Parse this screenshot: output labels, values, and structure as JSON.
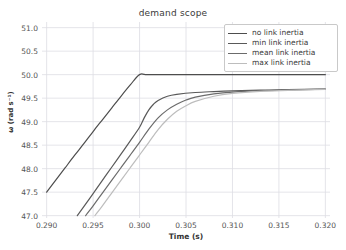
{
  "chart_data": {
    "type": "line",
    "title": "demand scope",
    "xlabel": "Time (s)",
    "ylabel": "ω (rad s⁻¹)",
    "xlim": [
      0.2895,
      0.3205
    ],
    "ylim": [
      46.95,
      51.12
    ],
    "grid": true,
    "legend_position": "upper right",
    "xticks": [
      0.29,
      0.295,
      0.3,
      0.305,
      0.31,
      0.315,
      0.32
    ],
    "xticklabels": [
      "0.290",
      "0.295",
      "0.300",
      "0.305",
      "0.310",
      "0.315",
      "0.320"
    ],
    "yticks": [
      47.0,
      47.5,
      48.0,
      48.5,
      49.0,
      49.5,
      50.0,
      50.5,
      51.0
    ],
    "yticklabels": [
      "47.0",
      "47.5",
      "48.0",
      "48.5",
      "49.0",
      "49.5",
      "50.0",
      "50.5",
      "51.0"
    ],
    "series": [
      {
        "name": "no link inertia",
        "color": "#4d4d4d",
        "width": 1.2,
        "x": [
          0.29,
          0.291,
          0.292,
          0.293,
          0.294,
          0.295,
          0.296,
          0.297,
          0.298,
          0.299,
          0.3,
          0.301,
          0.305,
          0.31,
          0.315,
          0.32
        ],
        "y": [
          47.5,
          47.76,
          48.02,
          48.28,
          48.53,
          48.79,
          49.04,
          49.29,
          49.54,
          49.78,
          50.0,
          50.0,
          50.0,
          50.0,
          50.0,
          50.0
        ]
      },
      {
        "name": "min link inertia",
        "color": "#595959",
        "width": 1.2,
        "x": [
          0.2933,
          0.294,
          0.295,
          0.296,
          0.297,
          0.298,
          0.299,
          0.3,
          0.3005,
          0.301,
          0.3015,
          0.302,
          0.303,
          0.304,
          0.306,
          0.308,
          0.31,
          0.313,
          0.316,
          0.32
        ],
        "y": [
          47.0,
          47.19,
          47.47,
          47.75,
          48.03,
          48.31,
          48.59,
          48.88,
          49.08,
          49.25,
          49.37,
          49.45,
          49.54,
          49.58,
          49.62,
          49.64,
          49.655,
          49.67,
          49.68,
          49.69
        ]
      },
      {
        "name": "mean link inertia",
        "color": "#6b6b6b",
        "width": 1.2,
        "x": [
          0.2942,
          0.295,
          0.296,
          0.297,
          0.298,
          0.299,
          0.3,
          0.301,
          0.302,
          0.303,
          0.304,
          0.305,
          0.306,
          0.308,
          0.31,
          0.313,
          0.316,
          0.32
        ],
        "y": [
          47.0,
          47.21,
          47.48,
          47.75,
          48.02,
          48.29,
          48.56,
          48.84,
          49.08,
          49.25,
          49.37,
          49.46,
          49.52,
          49.59,
          49.63,
          49.66,
          49.675,
          49.69
        ]
      },
      {
        "name": "max link inertia",
        "color": "#bdbdbd",
        "width": 1.2,
        "x": [
          0.2952,
          0.296,
          0.297,
          0.298,
          0.299,
          0.3,
          0.301,
          0.302,
          0.303,
          0.304,
          0.305,
          0.306,
          0.308,
          0.31,
          0.313,
          0.316,
          0.32
        ],
        "y": [
          47.0,
          47.21,
          47.48,
          47.75,
          48.02,
          48.29,
          48.56,
          48.83,
          49.05,
          49.22,
          49.34,
          49.43,
          49.54,
          49.6,
          49.645,
          49.665,
          49.685
        ]
      }
    ]
  },
  "style": {
    "grid_color": "#dddde3",
    "background": "#ffffff",
    "tick_color": "#555555",
    "title_color": "#3a3a3a",
    "legend_border": "#c9c9c9"
  }
}
